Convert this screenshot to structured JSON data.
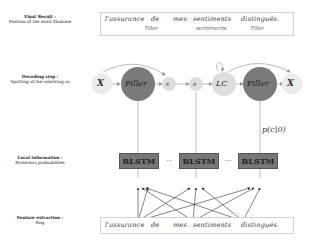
{
  "steps": [
    {
      "title": "Final Result :",
      "desc": "Position of the word Madame"
    },
    {
      "title": "Decoding step :",
      "desc": "Spotting of the substring as"
    },
    {
      "title": "Local information :",
      "desc": "Posteriors probabilities"
    },
    {
      "title": "Feature extraction :",
      "desc": "Hog"
    }
  ],
  "final_result": {
    "words": [
      "l'assurance",
      "de",
      "mes",
      "sentiments",
      "distingués."
    ],
    "tags": [
      "Filler",
      "sentiments",
      "Filler"
    ]
  },
  "decoding": {
    "nodes": [
      "X",
      "Filler",
      "s",
      "e",
      "LC",
      "Filler",
      "X"
    ]
  },
  "local_info": {
    "blocks": [
      "BLSTM",
      "BLSTM",
      "BLSTM"
    ],
    "ellipsis": "...",
    "probability_label": "p(c|0)"
  },
  "feature_extraction": {
    "words": [
      "l'assurance",
      "de",
      "mes",
      "sentiments",
      "distingués."
    ]
  },
  "colors": {
    "filler_node": "#7a7a7a",
    "light_node": "#dddddd",
    "pale_node": "#ececec",
    "blstm_fill": "#777777",
    "edge": "#aaaaaa"
  }
}
